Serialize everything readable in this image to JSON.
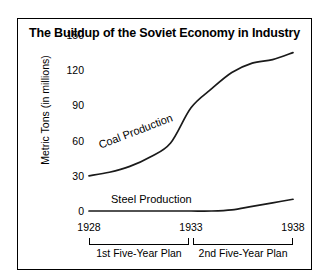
{
  "chart_data": {
    "type": "line",
    "title": "The Buildup of the Soviet Economy in Industry",
    "xlabel": "",
    "ylabel": "Metric Tons (in millions)",
    "ylim": [
      0,
      150
    ],
    "xlim": [
      1928,
      1938
    ],
    "yticks": [
      0,
      30,
      60,
      90,
      120,
      150
    ],
    "ytick_labels": [
      "0",
      "30",
      "60",
      "90",
      "120",
      "150"
    ],
    "xticks": [
      1928,
      1933,
      1938
    ],
    "xtick_labels": [
      "1928",
      "1933",
      "1938"
    ],
    "grid": false,
    "legend": "inline-labels",
    "series": [
      {
        "name": "Coal Production",
        "label": "Coal Production",
        "x": [
          1928,
          1929,
          1930,
          1931,
          1932,
          1933,
          1934,
          1935,
          1936,
          1937,
          1938
        ],
        "values": [
          30,
          33,
          38,
          46,
          58,
          88,
          104,
          118,
          126,
          129,
          135
        ]
      },
      {
        "name": "Steel Production",
        "label": "Steel Production",
        "x": [
          1928,
          1929,
          1930,
          1931,
          1932,
          1933,
          1934,
          1935,
          1936,
          1937,
          1938
        ],
        "values": [
          0,
          0,
          0,
          0,
          0,
          0,
          0,
          1,
          4,
          7,
          10
        ]
      }
    ],
    "annotations": [
      {
        "name": "1st Five-Year Plan",
        "start": 1928,
        "end": 1933
      },
      {
        "name": "2nd Five-Year Plan",
        "start": 1933,
        "end": 1938
      }
    ],
    "colors": {
      "line": "#1a1a1a",
      "border": "#000000",
      "background": "#ffffff",
      "text": "#000000"
    }
  },
  "periods": [
    {
      "label": "1st Five-Year Plan"
    },
    {
      "label": "2nd Five-Year Plan"
    }
  ]
}
